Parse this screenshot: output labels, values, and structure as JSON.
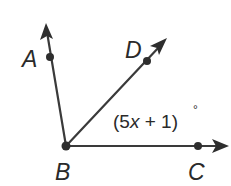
{
  "diagram": {
    "type": "angle-figure",
    "vertex": "B",
    "points": {
      "A": {
        "label": "A",
        "x": 50,
        "y": 57,
        "label_x": 22,
        "label_y": 67
      },
      "B": {
        "label": "B",
        "x": 66,
        "y": 146,
        "label_x": 55,
        "label_y": 180
      },
      "C": {
        "label": "C",
        "x": 198,
        "y": 146,
        "label_x": 188,
        "label_y": 180
      },
      "D": {
        "label": "D",
        "x": 147,
        "y": 61,
        "label_x": 125,
        "label_y": 58
      }
    },
    "rays": [
      {
        "name": "ray-BA",
        "from": "B",
        "through": "A"
      },
      {
        "name": "ray-BD",
        "from": "B",
        "through": "D"
      },
      {
        "name": "ray-BC",
        "from": "B",
        "through": "C"
      }
    ],
    "angle_label": {
      "angle": "DBC",
      "open_paren": "(",
      "coefficient": "5",
      "variable": "x",
      "operator": " + ",
      "constant": "1",
      "close_paren": ")",
      "degree": "°",
      "full_text": "(5x + 1)°"
    },
    "colors": {
      "stroke": "#3a3a3a",
      "point": "#2e2e2e",
      "text": "#2a2a2a",
      "background": "#ffffff"
    }
  }
}
